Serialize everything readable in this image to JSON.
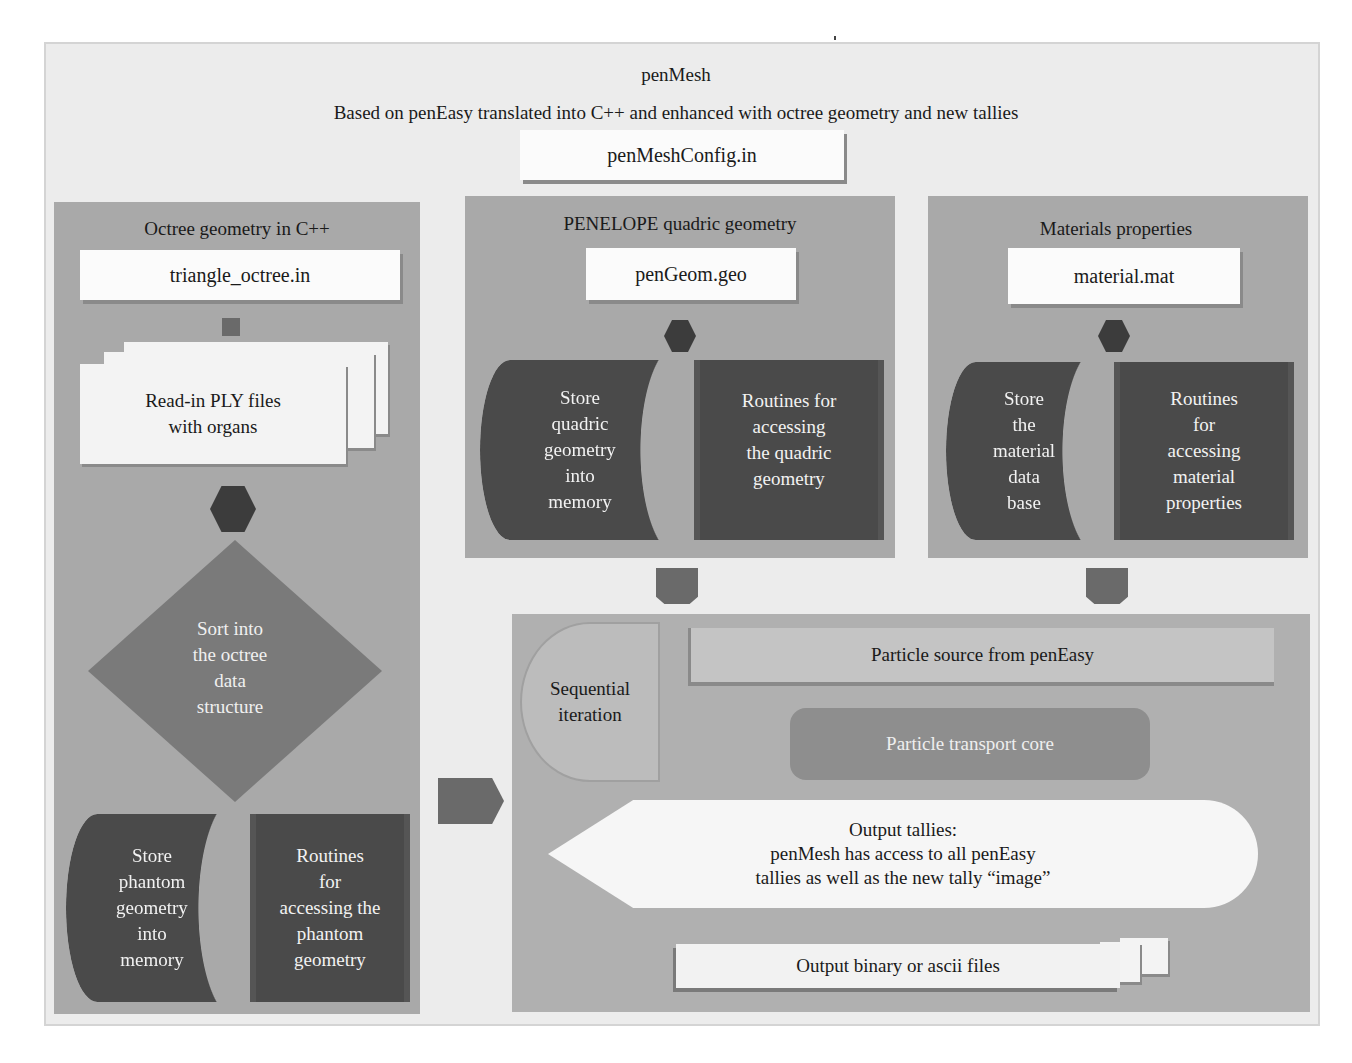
{
  "header": {
    "title": "penMesh",
    "subtitle": "Based on penEasy translated into C++ and enhanced with octree geometry and new tallies",
    "config_file": "penMeshConfig.in"
  },
  "octree_panel": {
    "title": "Octree geometry in C++",
    "input_file": "triangle_octree.in",
    "read_step": [
      "Read-in PLY files",
      "with organs"
    ],
    "decision": [
      "Sort into",
      "the octree",
      "data",
      "structure"
    ],
    "store": [
      "Store",
      "phantom",
      "geometry",
      "into",
      "memory"
    ],
    "routines": [
      "Routines",
      "for",
      "accessing the",
      "phantom",
      "geometry"
    ]
  },
  "quadric_panel": {
    "title": "PENELOPE quadric geometry",
    "input_file": "penGeom.geo",
    "store": [
      "Store",
      "quadric",
      "geometry",
      "into",
      "memory"
    ],
    "routines": [
      "Routines for",
      "accessing",
      "the quadric",
      "geometry"
    ]
  },
  "materials_panel": {
    "title": "Materials properties",
    "input_file": "material.mat",
    "store": [
      "Store",
      "the",
      "material",
      "data",
      "base"
    ],
    "routines": [
      "Routines",
      "for",
      "accessing",
      "material",
      "properties"
    ]
  },
  "simulation_panel": {
    "loop_label": [
      "Sequential",
      "iteration"
    ],
    "source": "Particle source from penEasy",
    "core": "Particle transport core",
    "tallies": [
      "Output tallies:",
      "penMesh has access to all penEasy",
      "tallies as well as the new tally “image”"
    ],
    "output": "Output binary or ascii files"
  },
  "colors": {
    "background": "#ececec",
    "panel": "#a9a9a9",
    "dark_block": "#4a4a4a",
    "document": "#fbfbfb",
    "connector": "#3c3c3c"
  }
}
